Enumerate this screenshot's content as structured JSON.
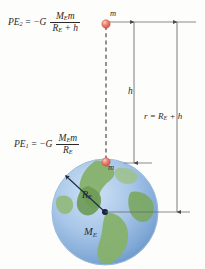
{
  "figure": {
    "background_color": "#fdfdfb"
  },
  "equations": {
    "pe2": {
      "lhs": "PE",
      "lhs_sub": "2",
      "equals": "=",
      "sign_constant": "−G",
      "numerator": "M",
      "numerator_sub": "E",
      "numerator_tail": "m",
      "denominator": "R",
      "denominator_sub": "E",
      "denominator_tail": "+ h"
    },
    "pe1": {
      "lhs": "PE",
      "lhs_sub": "1",
      "equals": "=",
      "sign_constant": "−G",
      "numerator": "M",
      "numerator_sub": "E",
      "numerator_tail": "m",
      "denominator": "R",
      "denominator_sub": "E",
      "denominator_tail": ""
    }
  },
  "labels": {
    "r_relation": "r = R",
    "r_relation_sub": "E",
    "r_relation_tail": "+ h",
    "height": "h",
    "mass_top": "m",
    "mass_surface": "m",
    "earth_radius": "R",
    "earth_radius_sub": "E",
    "earth_mass": "M",
    "earth_mass_sub": "E"
  },
  "colors": {
    "mass_marker": "#e8705f",
    "mass_marker_highlight": "#f4b5a8",
    "ocean": "#a8c6e8",
    "ocean_deep": "#7ea9d6",
    "land": "#86b16a",
    "land_dark": "#6d9a55",
    "line": "#6d6d6d",
    "dashed_line": "#3a3a3a",
    "radius_line": "#1d2b3f",
    "text": "#2a2a2a"
  },
  "geometry": {
    "earth_center_x": 105,
    "earth_center_y": 212,
    "earth_radius_px": 53,
    "mass_top_x": 106,
    "mass_top_y": 24,
    "mass_surface_x": 106,
    "mass_surface_y": 162,
    "top_rule_y": 22,
    "h_line_x": 134,
    "r_line_x": 177
  }
}
